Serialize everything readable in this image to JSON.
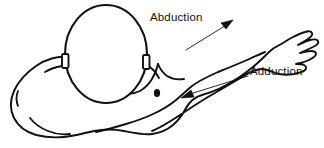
{
  "figure": {
    "title": "",
    "type": "anatomical-line-drawing",
    "background_color": "#ffffff",
    "ink_color": "#111111",
    "annotations": [
      {
        "id": "abduction",
        "label": "Abduction",
        "arrow_direction": "up-right",
        "arrow_from": [
          188,
          48
        ],
        "arrow_to": [
          232,
          22
        ]
      },
      {
        "id": "adduction",
        "label": "Adduction",
        "arrow_direction": "down-left",
        "arrow_from": [
          247,
          76
        ],
        "arrow_to": [
          182,
          97
        ]
      }
    ],
    "body_parts": [
      {
        "id": "head",
        "name": "head"
      },
      {
        "id": "ear-left",
        "name": "left-ear"
      },
      {
        "id": "ear-right",
        "name": "right-ear"
      },
      {
        "id": "torso",
        "name": "torso"
      },
      {
        "id": "arm",
        "name": "extended-arm"
      },
      {
        "id": "hand",
        "name": "hand"
      },
      {
        "id": "nipple",
        "name": "nipple-mark"
      }
    ]
  }
}
